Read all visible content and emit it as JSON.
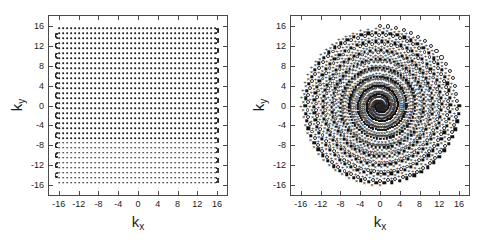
{
  "figure": {
    "panel_count": 2,
    "background_color": "#ffffff",
    "marker_color": "#1b1b1b",
    "axis_color": "#4a4a4a"
  },
  "panels": [
    {
      "id": "epi-panel",
      "name": "epi-trajectory-plot",
      "xlabel": "k",
      "xlabel_sub": "x",
      "ylabel": "k",
      "ylabel_sub": "y",
      "xticks": [
        "-16",
        "-12",
        "-8",
        "-4",
        "0",
        "4",
        "8",
        "12",
        "16"
      ],
      "yticks": [
        "16",
        "12",
        "8",
        "4",
        "0",
        "-4",
        "-8",
        "-12",
        "-16"
      ]
    },
    {
      "id": "spiral-panel",
      "name": "spiral-trajectory-plot",
      "xlabel": "k",
      "xlabel_sub": "x",
      "ylabel": "k",
      "ylabel_sub": "y",
      "xticks": [
        "-16",
        "-12",
        "-8",
        "-4",
        "0",
        "4",
        "8",
        "12",
        "16"
      ],
      "yticks": [
        "16",
        "12",
        "8",
        "4",
        "0",
        "-4",
        "-8",
        "-12",
        "-16"
      ]
    }
  ],
  "chart_data": [
    {
      "type": "scatter",
      "title": "",
      "subtitle": "",
      "panel": "left",
      "trajectory": "epi-zigzag-raster",
      "xlabel": "k_x",
      "ylabel": "k_y",
      "xlim": [
        -18,
        18
      ],
      "ylim": [
        -18,
        18
      ],
      "xticks": [
        -16,
        -12,
        -8,
        -4,
        0,
        4,
        8,
        12,
        16
      ],
      "yticks": [
        -16,
        -12,
        -8,
        -4,
        0,
        4,
        8,
        12,
        16
      ],
      "grid": false,
      "legend": false,
      "series": [
        {
          "name": "EPI readout",
          "marker": "dot",
          "n_lines": 32,
          "ky_min": -15.5,
          "ky_max": 15.5,
          "ky_step": 1.0,
          "kx_min": -16.0,
          "kx_max": 15.6,
          "samples_per_line": 40,
          "turn_radius": 0.55,
          "description": "Bidirectional raster lines spanning kx with U-turn blips connecting successive ky lines at the left and right edges."
        }
      ]
    },
    {
      "type": "scatter",
      "title": "",
      "subtitle": "",
      "panel": "right",
      "trajectory": "spiral-interleaved",
      "xlabel": "k_x",
      "ylabel": "k_y",
      "xlim": [
        -18,
        18
      ],
      "ylim": [
        -18,
        18
      ],
      "xticks": [
        -16,
        -12,
        -8,
        -4,
        0,
        4,
        8,
        12,
        16
      ],
      "yticks": [
        -16,
        -12,
        -8,
        -4,
        0,
        4,
        8,
        12,
        16
      ],
      "grid": false,
      "legend": false,
      "n_interleaves": 4,
      "n_turns": 9.0,
      "r_max": 16.0,
      "series": [
        {
          "name": "interleave 1",
          "marker": "square",
          "phase_deg": 0,
          "n_points": 560
        },
        {
          "name": "interleave 2",
          "marker": "circle",
          "phase_deg": 90,
          "n_points": 560
        },
        {
          "name": "interleave 3",
          "marker": "plus",
          "phase_deg": 180,
          "n_points": 560
        },
        {
          "name": "interleave 4",
          "marker": "ex",
          "phase_deg": 270,
          "n_points": 560
        }
      ],
      "description": "Four-arm interleaved Archimedean spiral sampled from k-space center outward to |k| = 16, each arm drawn with a distinct marker glyph."
    }
  ]
}
